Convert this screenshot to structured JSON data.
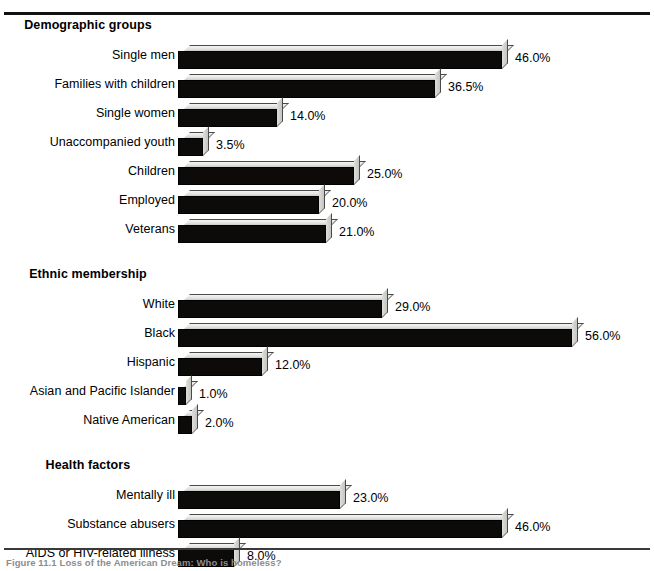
{
  "figure": {
    "caption": "Figure 11.1  Loss of the American Dream: Who is homeless?"
  },
  "chart_data": {
    "type": "bar",
    "orientation": "horizontal",
    "title": "",
    "xlabel": "",
    "ylabel": "",
    "xlim": [
      0,
      56
    ],
    "grid": false,
    "legend": null,
    "value_suffix": "%",
    "groups": [
      {
        "name": "Demographic groups",
        "categories": [
          "Single men",
          "Families with children",
          "Single women",
          "Unaccompanied youth",
          "Children",
          "Employed",
          "Veterans"
        ],
        "values": [
          46.0,
          36.5,
          14.0,
          3.5,
          25.0,
          20.0,
          21.0
        ],
        "labels": [
          "46.0%",
          "36.5%",
          "14.0%",
          "3.5%",
          "25.0%",
          "20.0%",
          "21.0%"
        ]
      },
      {
        "name": "Ethnic membership",
        "categories": [
          "White",
          "Black",
          "Hispanic",
          "Asian and Pacific Islander",
          "Native American"
        ],
        "values": [
          29.0,
          56.0,
          12.0,
          1.0,
          2.0
        ],
        "labels": [
          "29.0%",
          "56.0%",
          "12.0%",
          "1.0%",
          "2.0%"
        ]
      },
      {
        "name": "Health factors",
        "categories": [
          "Mentally ill",
          "Substance abusers",
          "AIDS or HIV-related illness"
        ],
        "values": [
          23.0,
          46.0,
          8.0
        ],
        "labels": [
          "23.0%",
          "46.0%",
          "8.0%"
        ]
      }
    ],
    "colors": {
      "bar_front": "#0d0b0a",
      "bar_top": "#e3e3e1",
      "bar_side": "#c4c4c1",
      "text": "#000000",
      "rule": "#111111"
    }
  }
}
